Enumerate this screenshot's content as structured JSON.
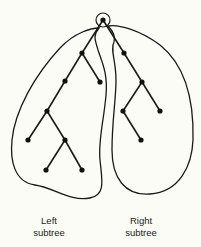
{
  "diagram": {
    "type": "binary-tree",
    "colors": {
      "stroke": "#1a1a1a",
      "node": "#111111",
      "background": "#fcfcf6"
    },
    "root": {
      "id": "root",
      "x": 103,
      "y": 20,
      "highlighted": true
    },
    "nodes": [
      {
        "id": "L1",
        "x": 82,
        "y": 53
      },
      {
        "id": "L2",
        "x": 65,
        "y": 81
      },
      {
        "id": "L3",
        "x": 100,
        "y": 82
      },
      {
        "id": "L4",
        "x": 47,
        "y": 111
      },
      {
        "id": "L5",
        "x": 28,
        "y": 140
      },
      {
        "id": "L6",
        "x": 65,
        "y": 140
      },
      {
        "id": "L7",
        "x": 46,
        "y": 170
      },
      {
        "id": "L8",
        "x": 82,
        "y": 170
      },
      {
        "id": "R1",
        "x": 124,
        "y": 53
      },
      {
        "id": "R2",
        "x": 142,
        "y": 82
      },
      {
        "id": "R3",
        "x": 123,
        "y": 111
      },
      {
        "id": "R4",
        "x": 160,
        "y": 111
      },
      {
        "id": "R5",
        "x": 141,
        "y": 140
      }
    ],
    "edges": [
      [
        "root",
        "L1"
      ],
      [
        "L1",
        "L2"
      ],
      [
        "L1",
        "L3"
      ],
      [
        "L2",
        "L4"
      ],
      [
        "L4",
        "L5"
      ],
      [
        "L4",
        "L6"
      ],
      [
        "L6",
        "L7"
      ],
      [
        "L6",
        "L8"
      ],
      [
        "root",
        "R1"
      ],
      [
        "R1",
        "R2"
      ],
      [
        "R2",
        "R3"
      ],
      [
        "R2",
        "R4"
      ],
      [
        "R3",
        "R5"
      ]
    ],
    "labels": {
      "left": {
        "line1": "Left",
        "line2": "subtree"
      },
      "right": {
        "line1": "Right",
        "line2": "subtree"
      }
    }
  }
}
